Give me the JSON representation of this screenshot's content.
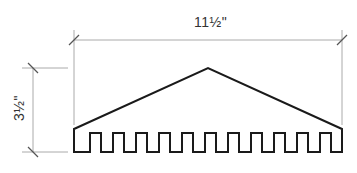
{
  "diagram": {
    "type": "technical-drawing",
    "dimensions": {
      "width_label": "11½\"",
      "height_label": "3½\""
    },
    "shape": {
      "stroke_color": "#1a1a1a",
      "dimension_line_color": "#aaaaaa",
      "notch_count": 12
    }
  }
}
